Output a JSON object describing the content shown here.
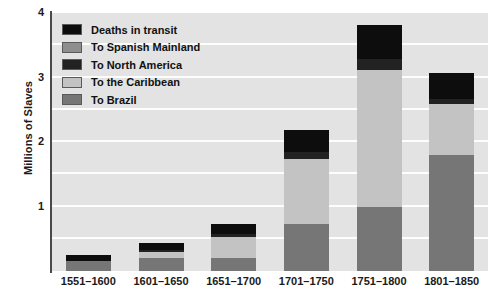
{
  "chart_data": {
    "type": "bar",
    "title": "",
    "subtitle": "",
    "xlabel": "",
    "ylabel": "Millions of Slaves",
    "stacked": true,
    "grid": true,
    "grid_orientation": "horizontal",
    "gridline_interval": 0.5,
    "legend_position": "top-left inside plot",
    "ylim": [
      0,
      4
    ],
    "yticks": [
      1,
      2,
      3,
      4
    ],
    "ytick_labels": [
      "1",
      "2",
      "3",
      "4"
    ],
    "categories": [
      "1551–1600",
      "1601–1650",
      "1651–1700",
      "1701–1750",
      "1751–1800",
      "1801–1850"
    ],
    "series": [
      {
        "name": "To Brazil",
        "color": "#767676",
        "values": [
          0.15,
          0.2,
          0.2,
          0.73,
          1.0,
          1.8
        ]
      },
      {
        "name": "To the Caribbean",
        "color": "#c3c3c3",
        "values": [
          0.0,
          0.1,
          0.33,
          1.0,
          2.12,
          0.79
        ]
      },
      {
        "name": "To North America",
        "color": "#222222",
        "values": [
          0.0,
          0.02,
          0.05,
          0.12,
          0.17,
          0.08
        ]
      },
      {
        "name": "To Spanish Mainland",
        "color": "#8e8e8e",
        "values": [
          0.0,
          0.0,
          0.0,
          0.0,
          0.0,
          0.0
        ]
      },
      {
        "name": "Deaths in transit",
        "color": "#0d0d0d",
        "values": [
          0.1,
          0.11,
          0.15,
          0.34,
          0.52,
          0.4
        ]
      }
    ],
    "totals": [
      0.25,
      0.43,
      0.73,
      2.19,
      3.81,
      3.07
    ],
    "legend_order": [
      "Deaths in transit",
      "To Spanish Mainland",
      "To North America",
      "To the Caribbean",
      "To Brazil"
    ]
  },
  "colors": {
    "plot_background": "#e3e3e3",
    "gridline": "#fdfdfd",
    "axis": "#4a4a4a",
    "text": "#1a1a1a",
    "page_background": "#ffffff",
    "swatch_border": "#5a5a5a"
  }
}
